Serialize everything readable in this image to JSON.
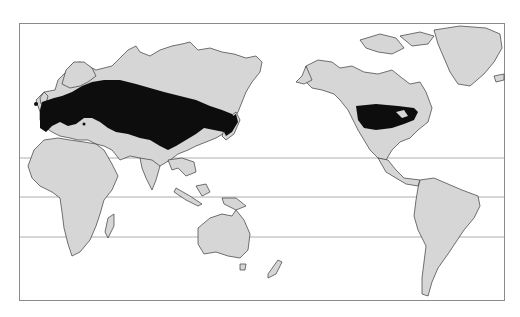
{
  "map": {
    "type": "world distribution map",
    "projection": "Pacific-centered (Eurasia/Africa left, Americas right)",
    "colors": {
      "land": "#d6d6d6",
      "range": "#0d0d0d",
      "ocean": "#ffffff",
      "latitude_lines": "#9a9a9a"
    },
    "latitude_lines_count": 3,
    "shaded_regions": [
      {
        "name": "Eurasian range",
        "extent": "Western Europe across central Eurasia to Japan"
      },
      {
        "name": "North American range",
        "extent": "Southern Canada and northern United States"
      }
    ],
    "continents_shown": [
      "Europe",
      "Asia",
      "Africa",
      "Australia",
      "North America",
      "South America",
      "Greenland",
      "New Zealand"
    ]
  }
}
